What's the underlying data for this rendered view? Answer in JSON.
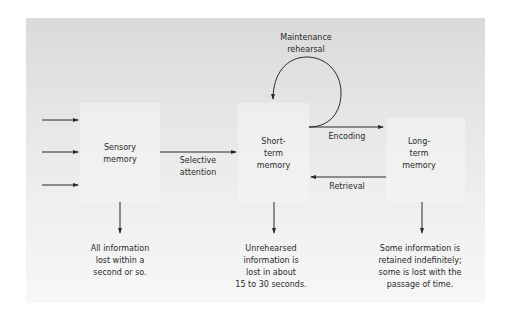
{
  "diagram": {
    "title": "",
    "stores": [
      {
        "id": "sensory",
        "label_line1": "Sensory",
        "label_line2": "memory"
      },
      {
        "id": "short_term",
        "label_line1": "Short-",
        "label_line2": "term",
        "label_line3": "memory"
      },
      {
        "id": "long_term",
        "label_line1": "Long-",
        "label_line2": "term",
        "label_line3": "memory"
      }
    ],
    "processes": {
      "selective_attention": {
        "line1": "Selective",
        "line2": "attention"
      },
      "encoding": "Encoding",
      "retrieval": "Retrieval",
      "maintenance_rehearsal": {
        "line1": "Maintenance",
        "line2": "rehearsal"
      }
    },
    "outcomes": {
      "sensory": {
        "line1": "All information",
        "line2": "lost within a",
        "line3": "second or so."
      },
      "short_term": {
        "line1": "Unrehearsed",
        "line2": "information is",
        "line3": "lost in about",
        "line4": "15 to 30 seconds."
      },
      "long_term": {
        "line1": "Some information is",
        "line2": "retained indefinitely;",
        "line3": "some is lost with the",
        "line4": "passage of time."
      }
    },
    "input_arrows": 3,
    "colors": {
      "panel_top": "#dadada",
      "panel_bottom": "#f7f7f7",
      "ink": "#2a2a2a"
    }
  }
}
